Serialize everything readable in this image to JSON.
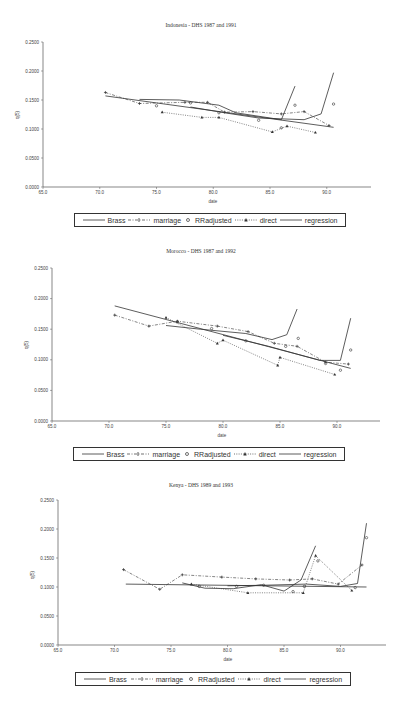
{
  "legend": {
    "items": [
      {
        "key": "brass",
        "label": "Brass"
      },
      {
        "key": "marriage",
        "label": "marriage"
      },
      {
        "key": "rradjusted",
        "label": "RRadjusted"
      },
      {
        "key": "direct",
        "label": "direct"
      },
      {
        "key": "regression",
        "label": "regression"
      }
    ]
  },
  "chart_data": [
    {
      "type": "line",
      "title": "Indonesia - DHS 1987 and 1991",
      "xlabel": "date",
      "ylabel": "q(5)",
      "xlim": [
        65,
        94
      ],
      "ylim": [
        0,
        0.25
      ],
      "xticks": [
        "65.0",
        "70.0",
        "75.0",
        "80.0",
        "85.0",
        "90.0"
      ],
      "yticks": [
        "0.0000",
        "0.0500",
        "0.1000",
        "0.1500",
        "0.2000",
        "0.2500"
      ],
      "grid": false,
      "legend_position": "bottom",
      "series": [
        {
          "name": "Brass",
          "style": "solid",
          "points": [
            [
              73.5,
              0.151
            ],
            [
              77.0,
              0.15
            ],
            [
              80.5,
              0.141
            ],
            [
              82.0,
              0.128
            ],
            [
              86.0,
              0.116
            ],
            [
              87.2,
              0.174
            ]
          ]
        },
        {
          "name": "Brass (1991)",
          "style": "solid",
          "points": [
            [
              78,
              0.138
            ],
            [
              81,
              0.128
            ],
            [
              84,
              0.119
            ],
            [
              88,
              0.116
            ],
            [
              89.5,
              0.126
            ],
            [
              90.6,
              0.197
            ]
          ]
        },
        {
          "name": "marriage",
          "style": "dashdot",
          "points": [
            [
              70.5,
              0.163
            ],
            [
              73.5,
              0.144
            ],
            [
              77.5,
              0.146
            ],
            [
              79.5,
              0.146
            ],
            [
              81,
              0.129
            ],
            [
              83.5,
              0.13
            ],
            [
              86,
              0.126
            ],
            [
              88,
              0.13
            ],
            [
              90.2,
              0.106
            ]
          ]
        },
        {
          "name": "RRadjusted",
          "style": "marker",
          "points": [
            [
              75,
              0.14
            ],
            [
              78,
              0.145
            ],
            [
              80.5,
              0.128
            ],
            [
              84,
              0.115
            ],
            [
              86,
              0.102
            ],
            [
              87.2,
              0.141
            ],
            [
              90.6,
              0.143
            ]
          ]
        },
        {
          "name": "direct",
          "style": "dotted",
          "points": [
            [
              75.5,
              0.129
            ],
            [
              79,
              0.12
            ],
            [
              80.5,
              0.12
            ],
            [
              85.2,
              0.095
            ],
            [
              86.5,
              0.105
            ],
            [
              89,
              0.094
            ]
          ]
        },
        {
          "name": "regression",
          "style": "solid",
          "points": [
            [
              70.5,
              0.157
            ],
            [
              90.6,
              0.103
            ]
          ]
        }
      ]
    },
    {
      "type": "line",
      "title": "Morocco - DHS 1987 and 1992",
      "xlabel": "date",
      "ylabel": "q(5)",
      "xlim": [
        65,
        94
      ],
      "ylim": [
        0,
        0.25
      ],
      "xticks": [
        "65.0",
        "70.0",
        "75.0",
        "80.0",
        "85.0",
        "90.0"
      ],
      "yticks": [
        "0.0000",
        "0.0500",
        "0.1000",
        "0.1500",
        "0.2000",
        "0.2500"
      ],
      "grid": false,
      "legend_position": "bottom",
      "series": [
        {
          "name": "Brass",
          "style": "solid",
          "points": [
            [
              75,
              0.156
            ],
            [
              78,
              0.15
            ],
            [
              82,
              0.143
            ],
            [
              84.3,
              0.133
            ],
            [
              85.6,
              0.141
            ],
            [
              86.5,
              0.183
            ]
          ]
        },
        {
          "name": "Brass (1992)",
          "style": "solid",
          "points": [
            [
              80,
              0.14
            ],
            [
              84,
              0.122
            ],
            [
              88.5,
              0.099
            ],
            [
              90.3,
              0.099
            ],
            [
              91.2,
              0.168
            ]
          ]
        },
        {
          "name": "marriage",
          "style": "dashdot",
          "points": [
            [
              70.5,
              0.173
            ],
            [
              73.5,
              0.155
            ],
            [
              76,
              0.163
            ],
            [
              79.5,
              0.155
            ],
            [
              82.2,
              0.146
            ],
            [
              84.5,
              0.127
            ],
            [
              86.5,
              0.122
            ],
            [
              89,
              0.096
            ],
            [
              91,
              0.093
            ]
          ]
        },
        {
          "name": "RRadjusted",
          "style": "marker",
          "points": [
            [
              76,
              0.162
            ],
            [
              79,
              0.151
            ],
            [
              82,
              0.131
            ],
            [
              85.5,
              0.122
            ],
            [
              86.6,
              0.135
            ],
            [
              89,
              0.094
            ],
            [
              90.3,
              0.083
            ],
            [
              91.2,
              0.116
            ]
          ]
        },
        {
          "name": "direct",
          "style": "dotted",
          "points": [
            [
              75,
              0.169
            ],
            [
              79.5,
              0.127
            ],
            [
              80,
              0.132
            ],
            [
              84.8,
              0.091
            ],
            [
              85,
              0.104
            ],
            [
              89.8,
              0.076
            ]
          ]
        },
        {
          "name": "regression",
          "style": "solid",
          "points": [
            [
              70.5,
              0.188
            ],
            [
              91.2,
              0.086
            ]
          ]
        }
      ]
    },
    {
      "type": "line",
      "title": "Kenya - DHS 1989 and 1993",
      "xlabel": "date",
      "ylabel": "q(5)",
      "xlim": [
        65,
        94
      ],
      "ylim": [
        0,
        0.25
      ],
      "xticks": [
        "65.0",
        "70.0",
        "75.0",
        "80.0",
        "85.0",
        "90.0"
      ],
      "yticks": [
        "0.0000",
        "0.0500",
        "0.1000",
        "0.1500",
        "0.2000",
        "0.2500"
      ],
      "grid": false,
      "legend_position": "bottom",
      "series": [
        {
          "name": "Brass",
          "style": "solid",
          "points": [
            [
              76,
              0.107
            ],
            [
              78,
              0.098
            ],
            [
              80.5,
              0.097
            ],
            [
              83,
              0.104
            ],
            [
              85,
              0.093
            ],
            [
              86.5,
              0.112
            ],
            [
              87.8,
              0.171
            ]
          ]
        },
        {
          "name": "Brass (1993)",
          "style": "solid",
          "points": [
            [
              80,
              0.102
            ],
            [
              83,
              0.103
            ],
            [
              87,
              0.105
            ],
            [
              90,
              0.101
            ],
            [
              91.5,
              0.106
            ],
            [
              92.3,
              0.21
            ]
          ]
        },
        {
          "name": "marriage",
          "style": "dashdot",
          "points": [
            [
              70.8,
              0.13
            ],
            [
              74,
              0.096
            ],
            [
              76,
              0.121
            ],
            [
              79.5,
              0.117
            ],
            [
              82.5,
              0.114
            ],
            [
              85.5,
              0.112
            ],
            [
              87.5,
              0.114
            ],
            [
              89.8,
              0.105
            ],
            [
              91.9,
              0.138
            ]
          ]
        },
        {
          "name": "RRadjusted",
          "style": "marker",
          "points": [
            [
              77.5,
              0.101
            ],
            [
              80.8,
              0.101
            ],
            [
              83.2,
              0.103
            ],
            [
              85.8,
              0.092
            ],
            [
              86.8,
              0.101
            ],
            [
              88,
              0.145
            ],
            [
              91.3,
              0.099
            ],
            [
              92.3,
              0.185
            ]
          ]
        },
        {
          "name": "direct",
          "style": "dotted",
          "points": [
            [
              76.8,
              0.105
            ],
            [
              81.8,
              0.09
            ],
            [
              86.7,
              0.09
            ],
            [
              87.8,
              0.154
            ],
            [
              91,
              0.094
            ]
          ]
        },
        {
          "name": "regression",
          "style": "solid",
          "points": [
            [
              71,
              0.105
            ],
            [
              92.3,
              0.1
            ]
          ]
        }
      ]
    }
  ]
}
